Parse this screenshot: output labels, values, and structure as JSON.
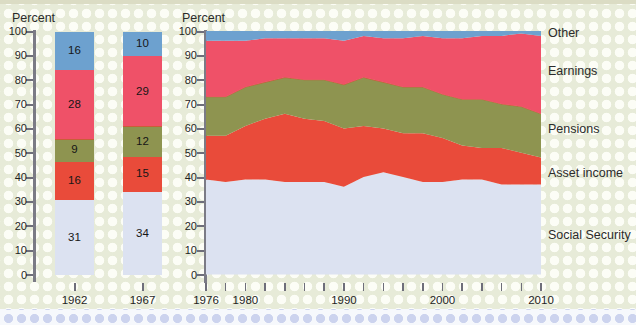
{
  "chart_data": [
    {
      "type": "bar",
      "stacked": true,
      "percent_label": "Percent",
      "categories": [
        "1962",
        "1967"
      ],
      "ylim": [
        0,
        100
      ],
      "yticks": [
        0,
        10,
        20,
        30,
        40,
        50,
        60,
        70,
        80,
        90,
        100
      ],
      "series": [
        {
          "name": "Social Security",
          "color": "#dce2f1",
          "values": [
            31,
            34
          ]
        },
        {
          "name": "Asset income",
          "color": "#e94b3a",
          "values": [
            16,
            15
          ]
        },
        {
          "name": "Pensions",
          "color": "#8e9450",
          "values": [
            9,
            12
          ]
        },
        {
          "name": "Earnings",
          "color": "#ef5168",
          "values": [
            28,
            29
          ]
        },
        {
          "name": "Other",
          "color": "#6da1cf",
          "values": [
            16,
            10
          ]
        }
      ]
    },
    {
      "type": "area",
      "stacked": true,
      "percent_label": "Percent",
      "x": [
        1976,
        1978,
        1980,
        1982,
        1984,
        1986,
        1988,
        1990,
        1992,
        1994,
        1996,
        1998,
        2000,
        2002,
        2004,
        2006,
        2008,
        2010
      ],
      "ylim": [
        0,
        100
      ],
      "yticks": [
        0,
        10,
        20,
        30,
        40,
        50,
        60,
        70,
        80,
        90,
        100
      ],
      "xtick_interval": 2,
      "xtick_labels": [
        1976,
        1980,
        1990,
        2000,
        2010
      ],
      "legend_position": "right",
      "grid": false,
      "series": [
        {
          "name": "Social Security",
          "color": "#dce2f1",
          "values": [
            39,
            38,
            39,
            39,
            38,
            38,
            38,
            36,
            40,
            42,
            40,
            38,
            38,
            39,
            39,
            37,
            37,
            37
          ]
        },
        {
          "name": "Asset income",
          "color": "#e94b3a",
          "values": [
            18,
            19,
            22,
            25,
            28,
            26,
            25,
            24,
            21,
            18,
            18,
            20,
            18,
            14,
            13,
            15,
            13,
            11
          ]
        },
        {
          "name": "Pensions",
          "color": "#8e9450",
          "values": [
            16,
            16,
            16,
            15,
            15,
            16,
            17,
            18,
            20,
            19,
            19,
            19,
            18,
            19,
            20,
            18,
            19,
            18
          ]
        },
        {
          "name": "Earnings",
          "color": "#ef5168",
          "values": [
            23,
            23,
            19,
            18,
            16,
            17,
            17,
            18,
            17,
            18,
            20,
            21,
            23,
            25,
            26,
            28,
            30,
            32
          ]
        },
        {
          "name": "Other",
          "color": "#6da1cf",
          "values": [
            4,
            4,
            4,
            3,
            3,
            3,
            3,
            4,
            2,
            3,
            3,
            2,
            3,
            3,
            2,
            2,
            1,
            2
          ]
        }
      ]
    }
  ],
  "colors": {
    "background": "#e7ebd8",
    "dot_pattern": "#fcfdf6",
    "axis": "#6e6e7a",
    "text": "#222222"
  }
}
